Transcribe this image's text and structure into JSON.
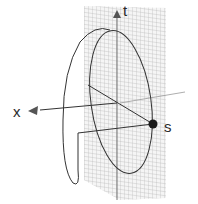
{
  "diagram": {
    "labels": {
      "t_axis": "t",
      "x_axis": "x",
      "point": "s"
    },
    "colors": {
      "curve": "#333333",
      "grid": "#b0b0b0",
      "axis": "#555555",
      "point": "#1a1a1a",
      "background": "#ffffff"
    },
    "elements": [
      "grid plane (t-s plane)",
      "t axis with arrow",
      "x axis with arrow",
      "ellipse in plane",
      "helical open curve",
      "point s"
    ]
  }
}
